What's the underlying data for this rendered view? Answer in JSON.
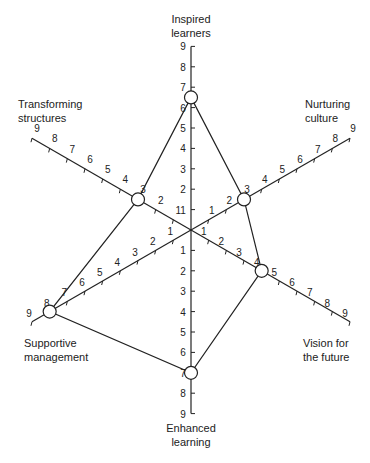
{
  "diagram": {
    "type": "radar",
    "scale_max": 9,
    "scale_ticks": [
      1,
      2,
      3,
      4,
      5,
      6,
      7,
      8,
      9
    ],
    "axes": [
      {
        "key": "top",
        "label": "Inspired\nlearners",
        "angle_deg": 90,
        "value": 6.5
      },
      {
        "key": "ur",
        "label": "Nurturing\nculture",
        "angle_deg": 30,
        "value": 3
      },
      {
        "key": "lr",
        "label": "Vision for\nthe future",
        "angle_deg": -30,
        "value": 4
      },
      {
        "key": "bot",
        "label": "Enhanced\nlearning",
        "angle_deg": -90,
        "value": 7
      },
      {
        "key": "ll",
        "label": "Supportive\nmanagement",
        "angle_deg": 210,
        "value": 8
      },
      {
        "key": "ul",
        "label": "Transforming\nstructures",
        "angle_deg": 150,
        "value": 3
      }
    ],
    "colors": {
      "line": "#222222",
      "background": "#ffffff"
    }
  },
  "chart_data": {
    "type": "radar",
    "categories": [
      "Inspired learners",
      "Nurturing culture",
      "Vision for the future",
      "Enhanced learning",
      "Supportive management",
      "Transforming structures"
    ],
    "values": [
      6.5,
      3,
      4,
      7,
      8,
      3
    ],
    "range": [
      0,
      9
    ],
    "ticks": [
      1,
      2,
      3,
      4,
      5,
      6,
      7,
      8,
      9
    ],
    "title": "",
    "legend": "none"
  },
  "labels": {
    "top": "Inspired\nlearners",
    "ur": "Nurturing\nculture",
    "lr": "Vision for\nthe future",
    "bot": "Enhanced\nlearning",
    "ll": "Supportive\nmanagement",
    "ul": "Transforming\nstructures"
  }
}
